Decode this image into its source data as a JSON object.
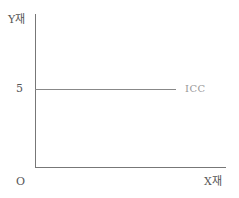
{
  "chart_data": {
    "type": "line",
    "title": "",
    "xlabel": "X재",
    "ylabel": "Y재",
    "origin_label": "O",
    "y_ticks": [
      "5"
    ],
    "x_ticks": [],
    "grid": false,
    "legend": null,
    "series": [
      {
        "name": "ICC",
        "x": [
          0,
          1
        ],
        "values": [
          5,
          5
        ],
        "style": "horizontal line at Y=5",
        "label_position": "right end of line"
      }
    ],
    "annotations": [
      "ICC"
    ],
    "ylim": [
      0,
      9
    ],
    "xlim": [
      0,
      1
    ]
  },
  "labels": {
    "y_axis": "Y재",
    "x_axis": "X재",
    "origin": "O",
    "y_tick_5": "5",
    "icc": "ICC"
  }
}
